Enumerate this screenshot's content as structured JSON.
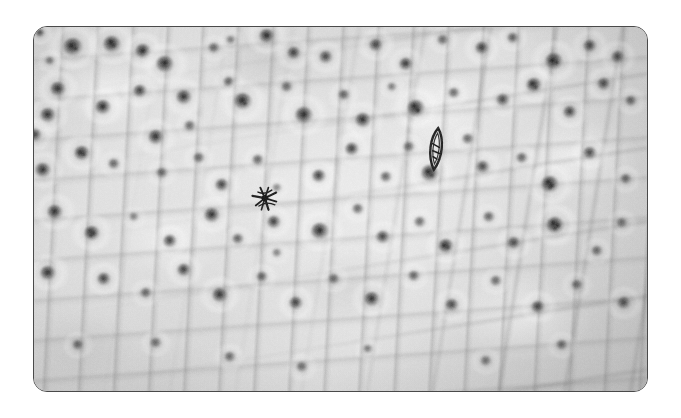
{
  "figure": {
    "kind": "light-micrograph",
    "caption": "",
    "page_background": "#ffffff",
    "plate": {
      "x": 33,
      "y": 26,
      "width": 615,
      "height": 366,
      "corner_radius": 14,
      "border_color": "#4a4a4a",
      "border_width": 1.2
    },
    "palette": {
      "background": "#ffffff",
      "tissue_light": "#e4e4e4",
      "tissue_mid": "#d4d4d4",
      "tissue_dark": "#b4b4b4",
      "cell_wall": "#8a8a8a",
      "nucleus": "#1e1e1e",
      "nucleolus": "#0a0a0a",
      "border": "#4a4a4a"
    }
  },
  "features": {
    "nuclei_count": 96,
    "mitotic_figure_count": 2,
    "nuclei": [
      {
        "cx": 6,
        "cy": 6,
        "r": 5,
        "op": 0.85,
        "nucleoli": []
      },
      {
        "cx": 39,
        "cy": 20,
        "r": 10,
        "op": 1.0,
        "nucleoli": [
          [
            -2,
            -1,
            4
          ],
          [
            3,
            2,
            3
          ]
        ]
      },
      {
        "cx": 16,
        "cy": 34,
        "r": 5,
        "op": 0.62,
        "nucleoli": []
      },
      {
        "cx": 78,
        "cy": 17,
        "r": 9,
        "op": 0.98,
        "nucleoli": [
          [
            -1,
            -2,
            4
          ],
          [
            2,
            2,
            3
          ]
        ]
      },
      {
        "cx": 109,
        "cy": 24,
        "r": 8,
        "op": 0.94,
        "nucleoli": [
          [
            0,
            0,
            4
          ]
        ]
      },
      {
        "cx": 131,
        "cy": 37,
        "r": 9,
        "op": 0.96,
        "nucleoli": [
          [
            0,
            -1,
            4
          ]
        ]
      },
      {
        "cx": 180,
        "cy": 21,
        "r": 6,
        "op": 0.7,
        "nucleoli": []
      },
      {
        "cx": 197,
        "cy": 13,
        "r": 5,
        "op": 0.6,
        "nucleoli": []
      },
      {
        "cx": 233,
        "cy": 9,
        "r": 8,
        "op": 0.95,
        "nucleoli": [
          [
            0,
            0,
            4
          ]
        ]
      },
      {
        "cx": 260,
        "cy": 26,
        "r": 7,
        "op": 0.88,
        "nucleoli": [
          [
            0,
            0,
            3
          ]
        ]
      },
      {
        "cx": 292,
        "cy": 30,
        "r": 7,
        "op": 0.84,
        "nucleoli": [
          [
            0,
            0,
            3
          ]
        ]
      },
      {
        "cx": 342,
        "cy": 18,
        "r": 7,
        "op": 0.86,
        "nucleoli": [
          [
            0,
            0,
            3
          ]
        ]
      },
      {
        "cx": 372,
        "cy": 37,
        "r": 7,
        "op": 0.9,
        "nucleoli": [
          [
            0,
            0,
            3
          ]
        ]
      },
      {
        "cx": 409,
        "cy": 13,
        "r": 6,
        "op": 0.72,
        "nucleoli": []
      },
      {
        "cx": 448,
        "cy": 21,
        "r": 7,
        "op": 0.88,
        "nucleoli": [
          [
            0,
            0,
            3
          ]
        ]
      },
      {
        "cx": 479,
        "cy": 11,
        "r": 6,
        "op": 0.78,
        "nucleoli": []
      },
      {
        "cx": 520,
        "cy": 34,
        "r": 9,
        "op": 0.98,
        "nucleoli": [
          [
            -2,
            0,
            4
          ],
          [
            3,
            2,
            3
          ]
        ]
      },
      {
        "cx": 556,
        "cy": 19,
        "r": 7,
        "op": 0.86,
        "nucleoli": [
          [
            0,
            0,
            3
          ]
        ]
      },
      {
        "cx": 584,
        "cy": 30,
        "r": 7,
        "op": 0.84,
        "nucleoli": [
          [
            0,
            0,
            3
          ]
        ]
      },
      {
        "cx": 24,
        "cy": 62,
        "r": 8,
        "op": 0.92,
        "nucleoli": [
          [
            0,
            0,
            4
          ]
        ]
      },
      {
        "cx": 14,
        "cy": 88,
        "r": 8,
        "op": 0.92,
        "nucleoli": [
          [
            0,
            0,
            4
          ]
        ]
      },
      {
        "cx": 1,
        "cy": 108,
        "r": 7,
        "op": 0.86,
        "nucleoli": [
          [
            0,
            0,
            3
          ]
        ]
      },
      {
        "cx": 69,
        "cy": 80,
        "r": 8,
        "op": 0.94,
        "nucleoli": [
          [
            0,
            0,
            4
          ]
        ]
      },
      {
        "cx": 106,
        "cy": 64,
        "r": 7,
        "op": 0.88,
        "nucleoli": [
          [
            0,
            0,
            3
          ]
        ]
      },
      {
        "cx": 150,
        "cy": 70,
        "r": 8,
        "op": 0.92,
        "nucleoli": [
          [
            0,
            0,
            4
          ]
        ]
      },
      {
        "cx": 156,
        "cy": 99,
        "r": 6,
        "op": 0.7,
        "nucleoli": []
      },
      {
        "cx": 195,
        "cy": 55,
        "r": 6,
        "op": 0.74,
        "nucleoli": []
      },
      {
        "cx": 209,
        "cy": 74,
        "r": 9,
        "op": 0.97,
        "nucleoli": [
          [
            -1,
            0,
            4
          ],
          [
            2,
            3,
            3
          ]
        ]
      },
      {
        "cx": 253,
        "cy": 60,
        "r": 6,
        "op": 0.7,
        "nucleoli": []
      },
      {
        "cx": 270,
        "cy": 88,
        "r": 9,
        "op": 0.96,
        "nucleoli": [
          [
            0,
            0,
            4
          ]
        ]
      },
      {
        "cx": 310,
        "cy": 68,
        "r": 6,
        "op": 0.76,
        "nucleoli": []
      },
      {
        "cx": 329,
        "cy": 93,
        "r": 8,
        "op": 0.92,
        "nucleoli": [
          [
            0,
            0,
            4
          ]
        ]
      },
      {
        "cx": 358,
        "cy": 60,
        "r": 5,
        "op": 0.6,
        "nucleoli": []
      },
      {
        "cx": 382,
        "cy": 81,
        "r": 9,
        "op": 0.97,
        "nucleoli": [
          [
            -2,
            -2,
            4
          ],
          [
            2,
            3,
            4
          ]
        ]
      },
      {
        "cx": 420,
        "cy": 66,
        "r": 6,
        "op": 0.72,
        "nucleoli": []
      },
      {
        "cx": 469,
        "cy": 73,
        "r": 7,
        "op": 0.82,
        "nucleoli": [
          [
            0,
            0,
            3
          ]
        ]
      },
      {
        "cx": 500,
        "cy": 58,
        "r": 8,
        "op": 0.94,
        "nucleoli": [
          [
            -2,
            -1,
            4
          ],
          [
            2,
            3,
            3
          ]
        ]
      },
      {
        "cx": 536,
        "cy": 85,
        "r": 7,
        "op": 0.86,
        "nucleoli": [
          [
            0,
            0,
            3
          ]
        ]
      },
      {
        "cx": 570,
        "cy": 57,
        "r": 7,
        "op": 0.84,
        "nucleoli": [
          [
            0,
            0,
            3
          ]
        ]
      },
      {
        "cx": 597,
        "cy": 74,
        "r": 6,
        "op": 0.76,
        "nucleoli": []
      },
      {
        "cx": 9,
        "cy": 143,
        "r": 8,
        "op": 0.92,
        "nucleoli": [
          [
            0,
            0,
            4
          ]
        ]
      },
      {
        "cx": 48,
        "cy": 126,
        "r": 8,
        "op": 0.94,
        "nucleoli": [
          [
            -2,
            0,
            4
          ],
          [
            2,
            2,
            3
          ]
        ]
      },
      {
        "cx": 80,
        "cy": 137,
        "r": 6,
        "op": 0.74,
        "nucleoli": []
      },
      {
        "cx": 122,
        "cy": 110,
        "r": 8,
        "op": 0.92,
        "nucleoli": [
          [
            0,
            0,
            4
          ]
        ]
      },
      {
        "cx": 128,
        "cy": 146,
        "r": 6,
        "op": 0.7,
        "nucleoli": []
      },
      {
        "cx": 165,
        "cy": 131,
        "r": 6,
        "op": 0.72,
        "nucleoli": []
      },
      {
        "cx": 188,
        "cy": 158,
        "r": 7,
        "op": 0.86,
        "nucleoli": [
          [
            0,
            0,
            3
          ]
        ]
      },
      {
        "cx": 224,
        "cy": 133,
        "r": 6,
        "op": 0.74,
        "nucleoli": []
      },
      {
        "cx": 243,
        "cy": 161,
        "r": 5,
        "op": 0.55,
        "nucleoli": []
      },
      {
        "cx": 285,
        "cy": 149,
        "r": 7,
        "op": 0.88,
        "nucleoli": [
          [
            0,
            0,
            3
          ]
        ]
      },
      {
        "cx": 318,
        "cy": 122,
        "r": 7,
        "op": 0.88,
        "nucleoli": [
          [
            0,
            0,
            3
          ]
        ]
      },
      {
        "cx": 352,
        "cy": 150,
        "r": 6,
        "op": 0.74,
        "nucleoli": []
      },
      {
        "cx": 375,
        "cy": 120,
        "r": 6,
        "op": 0.7,
        "nucleoli": []
      },
      {
        "cx": 396,
        "cy": 146,
        "r": 9,
        "op": 0.97,
        "nucleoli": [
          [
            -2,
            -1,
            4
          ],
          [
            2,
            3,
            3
          ]
        ]
      },
      {
        "cx": 434,
        "cy": 112,
        "r": 6,
        "op": 0.72,
        "nucleoli": []
      },
      {
        "cx": 449,
        "cy": 140,
        "r": 7,
        "op": 0.82,
        "nucleoli": [
          [
            0,
            0,
            3
          ]
        ]
      },
      {
        "cx": 488,
        "cy": 131,
        "r": 6,
        "op": 0.74,
        "nucleoli": []
      },
      {
        "cx": 516,
        "cy": 157,
        "r": 9,
        "op": 0.97,
        "nucleoli": [
          [
            -2,
            -2,
            4
          ],
          [
            2,
            2,
            4
          ],
          [
            0,
            4,
            3
          ]
        ]
      },
      {
        "cx": 556,
        "cy": 126,
        "r": 7,
        "op": 0.84,
        "nucleoli": [
          [
            0,
            0,
            3
          ]
        ]
      },
      {
        "cx": 592,
        "cy": 152,
        "r": 6,
        "op": 0.72,
        "nucleoli": []
      },
      {
        "cx": 21,
        "cy": 185,
        "r": 8,
        "op": 0.92,
        "nucleoli": [
          [
            0,
            0,
            4
          ]
        ]
      },
      {
        "cx": 58,
        "cy": 206,
        "r": 8,
        "op": 0.94,
        "nucleoli": [
          [
            -2,
            -2,
            3
          ],
          [
            2,
            1,
            3
          ],
          [
            -1,
            3,
            3
          ]
        ]
      },
      {
        "cx": 100,
        "cy": 190,
        "r": 5,
        "op": 0.55,
        "nucleoli": []
      },
      {
        "cx": 136,
        "cy": 214,
        "r": 7,
        "op": 0.86,
        "nucleoli": [
          [
            0,
            0,
            3
          ]
        ]
      },
      {
        "cx": 178,
        "cy": 188,
        "r": 8,
        "op": 0.92,
        "nucleoli": [
          [
            0,
            0,
            4
          ]
        ]
      },
      {
        "cx": 204,
        "cy": 212,
        "r": 6,
        "op": 0.74,
        "nucleoli": []
      },
      {
        "cx": 240,
        "cy": 195,
        "r": 7,
        "op": 0.88,
        "nucleoli": [
          [
            0,
            0,
            3
          ]
        ]
      },
      {
        "cx": 243,
        "cy": 226,
        "r": 5,
        "op": 0.58,
        "nucleoli": []
      },
      {
        "cx": 286,
        "cy": 204,
        "r": 9,
        "op": 0.96,
        "nucleoli": [
          [
            0,
            0,
            4
          ]
        ]
      },
      {
        "cx": 324,
        "cy": 182,
        "r": 6,
        "op": 0.72,
        "nucleoli": []
      },
      {
        "cx": 349,
        "cy": 210,
        "r": 7,
        "op": 0.84,
        "nucleoli": [
          [
            0,
            0,
            3
          ]
        ]
      },
      {
        "cx": 386,
        "cy": 195,
        "r": 6,
        "op": 0.7,
        "nucleoli": []
      },
      {
        "cx": 412,
        "cy": 219,
        "r": 8,
        "op": 0.94,
        "nucleoli": [
          [
            -2,
            0,
            4
          ],
          [
            2,
            2,
            3
          ]
        ]
      },
      {
        "cx": 455,
        "cy": 190,
        "r": 6,
        "op": 0.74,
        "nucleoli": []
      },
      {
        "cx": 480,
        "cy": 216,
        "r": 7,
        "op": 0.82,
        "nucleoli": [
          [
            0,
            0,
            3
          ]
        ]
      },
      {
        "cx": 521,
        "cy": 198,
        "r": 9,
        "op": 0.97,
        "nucleoli": [
          [
            -2,
            -2,
            4
          ],
          [
            3,
            1,
            4
          ],
          [
            0,
            4,
            3
          ]
        ]
      },
      {
        "cx": 563,
        "cy": 224,
        "r": 6,
        "op": 0.72,
        "nucleoli": []
      },
      {
        "cx": 588,
        "cy": 196,
        "r": 6,
        "op": 0.68,
        "nucleoli": []
      },
      {
        "cx": 14,
        "cy": 246,
        "r": 8,
        "op": 0.92,
        "nucleoli": [
          [
            0,
            0,
            4
          ]
        ]
      },
      {
        "cx": 70,
        "cy": 252,
        "r": 7,
        "op": 0.86,
        "nucleoli": [
          [
            0,
            0,
            3
          ]
        ]
      },
      {
        "cx": 112,
        "cy": 266,
        "r": 6,
        "op": 0.72,
        "nucleoli": []
      },
      {
        "cx": 150,
        "cy": 243,
        "r": 7,
        "op": 0.88,
        "nucleoli": [
          [
            0,
            0,
            3
          ]
        ]
      },
      {
        "cx": 186,
        "cy": 268,
        "r": 8,
        "op": 0.92,
        "nucleoli": [
          [
            0,
            0,
            4
          ]
        ]
      },
      {
        "cx": 228,
        "cy": 250,
        "r": 6,
        "op": 0.74,
        "nucleoli": []
      },
      {
        "cx": 262,
        "cy": 276,
        "r": 7,
        "op": 0.86,
        "nucleoli": [
          [
            0,
            0,
            3
          ]
        ]
      },
      {
        "cx": 300,
        "cy": 252,
        "r": 6,
        "op": 0.7,
        "nucleoli": []
      },
      {
        "cx": 338,
        "cy": 272,
        "r": 8,
        "op": 0.92,
        "nucleoli": [
          [
            0,
            0,
            4
          ]
        ]
      },
      {
        "cx": 380,
        "cy": 249,
        "r": 6,
        "op": 0.72,
        "nucleoli": []
      },
      {
        "cx": 418,
        "cy": 278,
        "r": 7,
        "op": 0.84,
        "nucleoli": [
          [
            0,
            0,
            3
          ]
        ]
      },
      {
        "cx": 462,
        "cy": 254,
        "r": 6,
        "op": 0.7,
        "nucleoli": []
      },
      {
        "cx": 504,
        "cy": 280,
        "r": 7,
        "op": 0.86,
        "nucleoli": [
          [
            0,
            0,
            3
          ]
        ]
      },
      {
        "cx": 543,
        "cy": 258,
        "r": 6,
        "op": 0.72,
        "nucleoli": []
      },
      {
        "cx": 590,
        "cy": 276,
        "r": 7,
        "op": 0.82,
        "nucleoli": [
          [
            0,
            0,
            3
          ]
        ]
      },
      {
        "cx": 44,
        "cy": 318,
        "r": 6,
        "op": 0.74,
        "nucleoli": []
      },
      {
        "cx": 122,
        "cy": 316,
        "r": 6,
        "op": 0.7,
        "nucleoli": []
      },
      {
        "cx": 196,
        "cy": 330,
        "r": 6,
        "op": 0.72,
        "nucleoli": []
      },
      {
        "cx": 268,
        "cy": 340,
        "r": 6,
        "op": 0.7,
        "nucleoli": []
      },
      {
        "cx": 334,
        "cy": 322,
        "r": 5,
        "op": 0.62,
        "nucleoli": []
      },
      {
        "cx": 452,
        "cy": 334,
        "r": 6,
        "op": 0.68,
        "nucleoli": []
      },
      {
        "cx": 528,
        "cy": 318,
        "r": 6,
        "op": 0.72,
        "nucleoli": []
      }
    ],
    "mitotic_figures": [
      {
        "id": "star-anaphase",
        "label": "mitotic figure (anaphase, star-shaped chromatin)",
        "cx": 232,
        "cy": 172,
        "width": 34,
        "height": 28,
        "rotation": -8
      },
      {
        "id": "spindle-metaphase",
        "label": "mitotic figure (metaphase, spindle-shaped)",
        "cx": 402,
        "cy": 122,
        "width": 22,
        "height": 40,
        "rotation": 6
      }
    ]
  }
}
